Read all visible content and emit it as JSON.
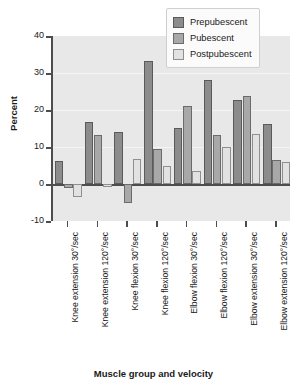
{
  "chart_data": {
    "type": "bar",
    "title": "",
    "xlabel": "Muscle group and velocity",
    "ylabel": "Percent",
    "ylim": [
      -10,
      40
    ],
    "yticks": [
      -10,
      0,
      10,
      20,
      30,
      40
    ],
    "ytick_labels": [
      "-10",
      "0",
      "10",
      "20",
      "30",
      "40"
    ],
    "grid": true,
    "legend_position": "top-right",
    "categories": [
      "Knee extension 30°/sec",
      "Knee extension 120°/sec",
      "Knee flexion 30°/sec",
      "Knee flexion 120°/sec",
      "Elbow flexion 30°/sec",
      "Elbow flexion 120°/sec",
      "Elbow extension 30°/sec",
      "Elbow extension 120°/sec"
    ],
    "series": [
      {
        "name": "Prepubescent",
        "color": "#8c8c8c",
        "values": [
          6.3,
          16.7,
          14.0,
          33.3,
          15.2,
          28.0,
          22.7,
          16.1
        ]
      },
      {
        "name": "Pubescent",
        "color": "#a8a8a8",
        "values": [
          -1.2,
          13.2,
          -5.0,
          9.5,
          21.0,
          13.2,
          23.7,
          6.4
        ]
      },
      {
        "name": "Postpubescent",
        "color": "#e2e2e2",
        "values": [
          -3.5,
          -0.8,
          6.7,
          4.8,
          3.5,
          10.1,
          13.6,
          5.9
        ]
      }
    ]
  },
  "legend": {
    "items": [
      {
        "label": "Prepubescent"
      },
      {
        "label": "Pubescent"
      },
      {
        "label": "Postpubescent"
      }
    ]
  },
  "axes": {
    "y_title": "Percent",
    "x_title": "Muscle group and velocity"
  }
}
